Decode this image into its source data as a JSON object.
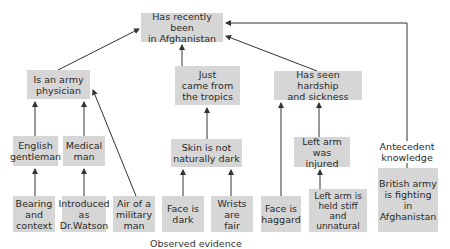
{
  "diagram": {
    "nodes": {
      "afghanistan": "Has recently been\nin Afghanistan",
      "physician": "Is an army\nphysician",
      "tropics": "Just\ncame from\nthe tropics",
      "hardship": "Has seen hardship\nand sickness",
      "gentleman": "English\ngentleman",
      "medical": "Medical\nman",
      "skin": "Skin is not\nnaturally dark",
      "arm_injured": "Left arm\nwas injured",
      "bearing": "Bearing\nand\ncontext",
      "watson": "Introduced\nas\nDr.Watson",
      "military": "Air of a\nmilitary\nman",
      "face_dark": "Face is\ndark",
      "wrists": "Wrists\nare\nfair",
      "haggard": "Face is\nhaggard",
      "arm_stiff": "Left arm is\nheld stiff\nand\nunnatural",
      "british_army": "British army\nis fighting\nin\nAfghanistan"
    },
    "antecedent_label": "Antecedent\nknowledge",
    "caption": "Observed evidence",
    "edges": [
      [
        "physician",
        "afghanistan"
      ],
      [
        "tropics",
        "afghanistan"
      ],
      [
        "hardship",
        "afghanistan"
      ],
      [
        "british_army",
        "afghanistan"
      ],
      [
        "gentleman",
        "physician"
      ],
      [
        "medical",
        "physician"
      ],
      [
        "military",
        "physician"
      ],
      [
        "skin",
        "tropics"
      ],
      [
        "haggard",
        "hardship"
      ],
      [
        "arm_injured",
        "hardship"
      ],
      [
        "bearing",
        "gentleman"
      ],
      [
        "watson",
        "medical"
      ],
      [
        "face_dark",
        "skin"
      ],
      [
        "wrists",
        "skin"
      ],
      [
        "arm_stiff",
        "arm_injured"
      ]
    ],
    "colors": {
      "box": "#d6d6d6",
      "line": "#333333"
    }
  }
}
